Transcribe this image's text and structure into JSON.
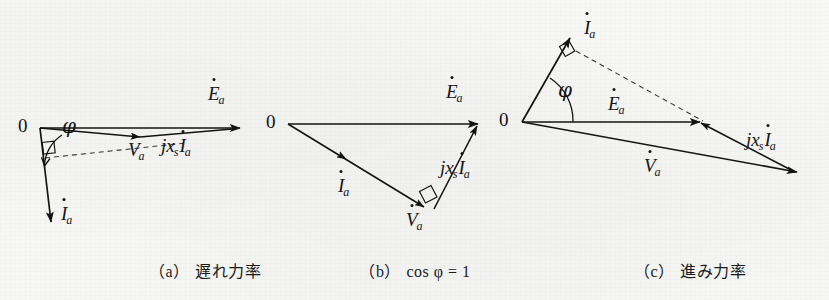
{
  "figure": {
    "background_color": "#f7f7f6",
    "ink_color": "#141414",
    "width": 829,
    "height": 300
  },
  "symbols": {
    "origin": "0",
    "phi": "φ",
    "E": "E",
    "V": "V",
    "I": "I",
    "sub_a": "a",
    "sub_s": "s",
    "j": "j",
    "x": "x"
  },
  "panels": [
    {
      "id": "a",
      "caption_paren_open": "（",
      "caption_letter": "a",
      "caption_paren_close": "）",
      "caption_text": "遅れ力率",
      "caption_x": 205,
      "caption_y": 268,
      "origin": {
        "label": "0",
        "x": 40,
        "y": 128,
        "label_x": 20,
        "label_y": 118
      },
      "angle_label": {
        "text": "φ",
        "x": 64,
        "y": 128
      },
      "vectors": [
        {
          "name": "Ea",
          "x1": 40,
          "y1": 128,
          "x2": 240,
          "y2": 128
        },
        {
          "name": "Va",
          "x1": 40,
          "y1": 128,
          "x2": 140,
          "y2": 137
        },
        {
          "name": "jxsIa",
          "x1": 140,
          "y1": 137,
          "x2": 240,
          "y2": 128
        },
        {
          "name": "Ia",
          "x1": 40,
          "y1": 128,
          "x2": 51,
          "y2": 222
        }
      ],
      "dashed": [
        {
          "name": "perpendicular-construction",
          "x1": 44,
          "y1": 157,
          "x2": 185,
          "y2": 143
        }
      ],
      "labels": [
        {
          "name": "Ea",
          "base": "E",
          "sub": "a",
          "x": 210,
          "y": 88
        },
        {
          "name": "Va",
          "base": "V",
          "sub": "a",
          "x": 130,
          "y": 142
        },
        {
          "name": "jxsIa",
          "prefix": "jx",
          "prefix_sub": "s",
          "base": "I",
          "sub": "a",
          "x": 163,
          "y": 138
        },
        {
          "name": "Ia",
          "base": "I",
          "sub": "a",
          "x": 62,
          "y": 208
        }
      ]
    },
    {
      "id": "b",
      "caption_paren_open": "（",
      "caption_letter": "b",
      "caption_paren_close": "）",
      "caption_formula": "cos φ = 1",
      "caption_x": 415,
      "caption_y": 268,
      "origin": {
        "label": "0",
        "x": 288,
        "y": 124,
        "label_x": 268,
        "label_y": 114
      },
      "vectors": [
        {
          "name": "Ea",
          "x1": 288,
          "y1": 124,
          "x2": 478,
          "y2": 124
        },
        {
          "name": "Ia",
          "x1": 288,
          "y1": 124,
          "x2": 422,
          "y2": 206
        },
        {
          "name": "jxsIa",
          "x1": 434,
          "y1": 209,
          "x2": 478,
          "y2": 124
        }
      ],
      "labels": [
        {
          "name": "Ea",
          "base": "E",
          "sub": "a",
          "x": 447,
          "y": 86
        },
        {
          "name": "Ia",
          "base": "I",
          "sub": "a",
          "x": 340,
          "y": 178
        },
        {
          "name": "Va",
          "base": "V",
          "sub": "a",
          "x": 408,
          "y": 212
        },
        {
          "name": "jxsIa",
          "prefix": "jx",
          "prefix_sub": "s",
          "base": "I",
          "sub": "a",
          "x": 442,
          "y": 160
        }
      ]
    },
    {
      "id": "c",
      "caption_paren_open": "（",
      "caption_letter": "c",
      "caption_paren_close": "）",
      "caption_text": "進み力率",
      "caption_x": 690,
      "caption_y": 268,
      "origin": {
        "label": "0",
        "x": 522,
        "y": 122,
        "label_x": 501,
        "label_y": 112
      },
      "angle_label": {
        "text": "φ",
        "x": 560,
        "y": 92
      },
      "vectors": [
        {
          "name": "Ia",
          "x1": 522,
          "y1": 122,
          "x2": 570,
          "y2": 38
        },
        {
          "name": "Ea",
          "x1": 522,
          "y1": 122,
          "x2": 700,
          "y2": 122
        },
        {
          "name": "Va",
          "x1": 522,
          "y1": 122,
          "x2": 796,
          "y2": 172
        },
        {
          "name": "jxsIa",
          "x1": 796,
          "y1": 172,
          "x2": 700,
          "y2": 122
        }
      ],
      "dashed": [
        {
          "name": "perpendicular-construction",
          "x1": 575,
          "y1": 50,
          "x2": 703,
          "y2": 121
        }
      ],
      "labels": [
        {
          "name": "Ia",
          "base": "I",
          "sub": "a",
          "x": 586,
          "y": 22
        },
        {
          "name": "Ea",
          "base": "E",
          "sub": "a",
          "x": 610,
          "y": 98
        },
        {
          "name": "Va",
          "base": "V",
          "sub": "a",
          "x": 646,
          "y": 160
        },
        {
          "name": "jxsIa",
          "prefix": "jx",
          "prefix_sub": "s",
          "base": "I",
          "sub": "a",
          "x": 748,
          "y": 132
        }
      ]
    }
  ]
}
